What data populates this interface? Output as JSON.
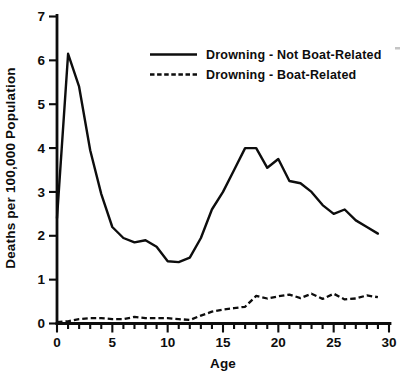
{
  "figure": {
    "background": "#ffffff",
    "ink_color": "#0d0d0d"
  },
  "y_axis": {
    "title": "Deaths per 100,000 Population",
    "min": 0,
    "max": 7,
    "ticks": [
      0,
      1,
      2,
      3,
      4,
      5,
      6,
      7
    ]
  },
  "x_axis": {
    "title": "Age",
    "min": 0,
    "max": 30,
    "major_ticks": [
      0,
      5,
      10,
      15,
      20,
      25,
      30
    ],
    "minor_tick_step": 1
  },
  "legend": {
    "items": [
      {
        "label": "Drowning - Not Boat-Related",
        "style": "solid"
      },
      {
        "label": "Drowning - Boat-Related",
        "style": "dashed"
      }
    ]
  },
  "chart_data": {
    "type": "line",
    "title": "",
    "xlabel": "Age",
    "ylabel": "Deaths per 100,000 Population",
    "xlim": [
      0,
      30
    ],
    "ylim": [
      0,
      7
    ],
    "grid": false,
    "legend_position": "upper-center-inside",
    "x": [
      0,
      1,
      2,
      3,
      4,
      5,
      6,
      7,
      8,
      9,
      10,
      11,
      12,
      13,
      14,
      15,
      16,
      17,
      18,
      19,
      20,
      21,
      22,
      23,
      24,
      25,
      26,
      27,
      28,
      29
    ],
    "series": [
      {
        "name": "Drowning - Not Boat-Related",
        "style": "solid",
        "values": [
          2.4,
          6.15,
          5.4,
          3.95,
          2.95,
          2.2,
          1.95,
          1.85,
          1.9,
          1.75,
          1.42,
          1.4,
          1.5,
          1.95,
          2.6,
          3.0,
          3.5,
          4.0,
          4.0,
          3.55,
          3.75,
          3.25,
          3.2,
          3.0,
          2.7,
          2.5,
          2.6,
          2.35,
          2.2,
          2.05
        ]
      },
      {
        "name": "Drowning - Boat-Related",
        "style": "dashed",
        "values": [
          0.03,
          0.05,
          0.1,
          0.12,
          0.12,
          0.1,
          0.1,
          0.15,
          0.12,
          0.12,
          0.12,
          0.1,
          0.08,
          0.18,
          0.27,
          0.32,
          0.35,
          0.38,
          0.63,
          0.57,
          0.62,
          0.66,
          0.58,
          0.68,
          0.56,
          0.68,
          0.55,
          0.57,
          0.64,
          0.6
        ]
      }
    ]
  }
}
